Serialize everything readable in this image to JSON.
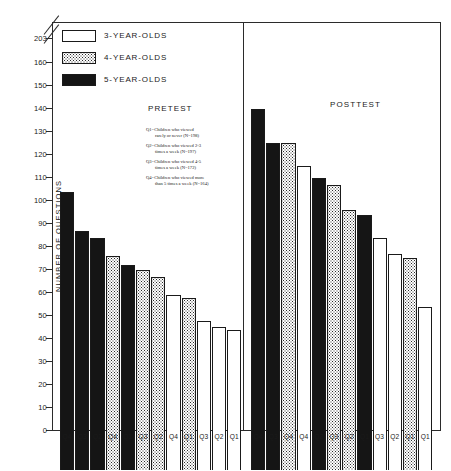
{
  "axis": {
    "ylabel": "NUMBER OF QUESTIONS",
    "ticks": [
      "203",
      "160",
      "150",
      "140",
      "130",
      "120",
      "110",
      "100",
      "90",
      "80",
      "70",
      "60",
      "50",
      "40",
      "30",
      "20",
      "10",
      "0"
    ],
    "break_note": "axis-break"
  },
  "legend": {
    "items": [
      {
        "label": "3-YEAR-OLDS",
        "fill": "white"
      },
      {
        "label": "4-YEAR-OLDS",
        "fill": "dotted"
      },
      {
        "label": "5-YEAR-OLDS",
        "fill": "black"
      }
    ]
  },
  "panels": {
    "pretest_title": "PRETEST",
    "posttest_title": "POSTTEST"
  },
  "notes": [
    {
      "line1": "Q1=Children who viewed",
      "line2": "rarely or never (N=198)"
    },
    {
      "line1": "Q2=Children who viewed 2-3",
      "line2": "times a week (N=197)"
    },
    {
      "line1": "Q3=Children who viewed 4-5",
      "line2": "times a week (N=172)"
    },
    {
      "line1": "Q4=Children who viewed more",
      "line2": "than 5 times a week (N=164)"
    }
  ],
  "chart_data": {
    "type": "bar",
    "title": "",
    "xlabel": "",
    "ylabel": "NUMBER OF QUESTIONS",
    "ylim": [
      0,
      165
    ],
    "ytick_values": [
      0,
      10,
      20,
      30,
      40,
      50,
      60,
      70,
      80,
      90,
      100,
      110,
      120,
      130,
      140,
      150,
      160,
      203
    ],
    "axis_break": {
      "between": [
        160,
        203
      ],
      "top_label": "203"
    },
    "grid": false,
    "legend_position": "top-left",
    "groups": [
      {
        "name": "PRETEST",
        "bars": [
          {
            "label": "Q4",
            "value": 121,
            "series": "5-YEAR-OLDS",
            "fill": "black"
          },
          {
            "label": "Q3",
            "value": 104,
            "series": "5-YEAR-OLDS",
            "fill": "black"
          },
          {
            "label": "Q2",
            "value": 101,
            "series": "5-YEAR-OLDS",
            "fill": "black"
          },
          {
            "label": "Q4",
            "value": 93,
            "series": "4-YEAR-OLDS",
            "fill": "dotted"
          },
          {
            "label": "Q1",
            "value": 89,
            "series": "5-YEAR-OLDS",
            "fill": "black"
          },
          {
            "label": "Q3",
            "value": 87,
            "series": "4-YEAR-OLDS",
            "fill": "dotted"
          },
          {
            "label": "Q2",
            "value": 84,
            "series": "4-YEAR-OLDS",
            "fill": "dotted"
          },
          {
            "label": "Q4",
            "value": 76,
            "series": "3-YEAR-OLDS",
            "fill": "white"
          },
          {
            "label": "Q1",
            "value": 75,
            "series": "4-YEAR-OLDS",
            "fill": "dotted"
          },
          {
            "label": "Q3",
            "value": 65,
            "series": "3-YEAR-OLDS",
            "fill": "white"
          },
          {
            "label": "Q2",
            "value": 62,
            "series": "3-YEAR-OLDS",
            "fill": "white"
          },
          {
            "label": "Q1",
            "value": 61,
            "series": "3-YEAR-OLDS",
            "fill": "white"
          }
        ]
      },
      {
        "name": "POSTTEST",
        "bars": [
          {
            "label": "Q4",
            "value": 157,
            "series": "5-YEAR-OLDS",
            "fill": "black"
          },
          {
            "label": "Q3",
            "value": 142,
            "series": "5-YEAR-OLDS",
            "fill": "black"
          },
          {
            "label": "Q4",
            "value": 142,
            "series": "4-YEAR-OLDS",
            "fill": "dotted"
          },
          {
            "label": "Q4",
            "value": 132,
            "series": "3-YEAR-OLDS",
            "fill": "white"
          },
          {
            "label": "Q2",
            "value": 127,
            "series": "5-YEAR-OLDS",
            "fill": "black"
          },
          {
            "label": "Q3",
            "value": 124,
            "series": "4-YEAR-OLDS",
            "fill": "dotted"
          },
          {
            "label": "Q2",
            "value": 113,
            "series": "4-YEAR-OLDS",
            "fill": "dotted"
          },
          {
            "label": "Q1",
            "value": 111,
            "series": "5-YEAR-OLDS",
            "fill": "black"
          },
          {
            "label": "Q3",
            "value": 101,
            "series": "3-YEAR-OLDS",
            "fill": "white"
          },
          {
            "label": "Q2",
            "value": 94,
            "series": "3-YEAR-OLDS",
            "fill": "white"
          },
          {
            "label": "Q1",
            "value": 92,
            "series": "4-YEAR-OLDS",
            "fill": "dotted"
          },
          {
            "label": "Q1",
            "value": 71,
            "series": "3-YEAR-OLDS",
            "fill": "white"
          }
        ]
      }
    ]
  }
}
